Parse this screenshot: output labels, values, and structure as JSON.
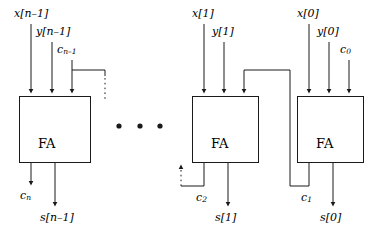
{
  "diagram": {
    "type": "block-diagram",
    "colors": {
      "stroke": "#1a1a1a",
      "text": "#000000",
      "background": "#ffffff"
    },
    "ellipsis": {
      "dots": 3,
      "label": "•"
    },
    "cells": [
      {
        "id": "fa-n-1",
        "block_label": "FA",
        "inputs": {
          "x": "x[n–1]",
          "y": "y[n–1]",
          "carry_in": "c"
        },
        "carry_in_sub": "n–1",
        "outputs": {
          "carry_out": "c",
          "carry_out_sub": "n",
          "sum": "s[n–1]"
        }
      },
      {
        "id": "fa-1",
        "block_label": "FA",
        "inputs": {
          "x": "x[1]",
          "y": "y[1]",
          "carry_in": ""
        },
        "carry_in_sub": "",
        "outputs": {
          "carry_out": "c",
          "carry_out_sub": "2",
          "sum": "s[1]"
        }
      },
      {
        "id": "fa-0",
        "block_label": "FA",
        "inputs": {
          "x": "x[0]",
          "y": "y[0]",
          "carry_in": "c"
        },
        "carry_in_sub": "0",
        "outputs": {
          "carry_out": "c",
          "carry_out_sub": "1",
          "sum": "s[0]"
        }
      }
    ],
    "labels": {
      "x_n1": "x[n–1]",
      "y_n1": "y[n–1]",
      "c_n1_base": "c",
      "c_n1_sub": "n–1",
      "c_n_base": "c",
      "c_n_sub": "n",
      "s_n1": "s[n–1]",
      "x_1": "x[1]",
      "y_1": "y[1]",
      "c_2_base": "c",
      "c_2_sub": "2",
      "s_1": "s[1]",
      "x_0": "x[0]",
      "y_0": "y[0]",
      "c_0_base": "c",
      "c_0_sub": "0",
      "c_1_base": "c",
      "c_1_sub": "1",
      "s_0": "s[0]",
      "fa": "FA",
      "dot": "•"
    }
  }
}
